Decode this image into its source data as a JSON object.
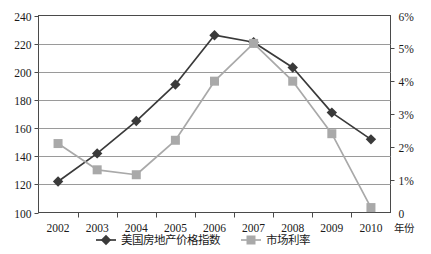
{
  "chart_data": {
    "type": "line",
    "title": "",
    "xlabel": "年份",
    "ylabel": "",
    "x": [
      2002,
      2003,
      2004,
      2005,
      2006,
      2007,
      2008,
      2009,
      2010
    ],
    "categories": [
      "2002",
      "2003",
      "2004",
      "2005",
      "2006",
      "2007",
      "2008",
      "2009",
      "2010"
    ],
    "grid": true,
    "legend_position": "bottom",
    "series": [
      {
        "name": "美国房地产价格指数",
        "axis": "left",
        "marker": "diamond",
        "color": "#3a3a3a",
        "values": [
          122,
          142,
          165,
          191,
          226,
          221,
          203,
          171,
          152
        ]
      },
      {
        "name": "市场利率",
        "axis": "right",
        "marker": "square",
        "color": "#a9a9a9",
        "values": [
          2.1,
          1.3,
          1.15,
          2.2,
          4.0,
          5.15,
          4.0,
          2.4,
          0.15
        ],
        "value_unit": "%"
      }
    ],
    "axes": {
      "left": {
        "min": 100,
        "max": 240,
        "step": 20,
        "ticks": [
          "100",
          "120",
          "140",
          "160",
          "180",
          "200",
          "220",
          "240"
        ]
      },
      "right": {
        "min": 0,
        "max": 6,
        "step": 1,
        "unit": "%",
        "ticks": [
          "0",
          "1%",
          "2%",
          "3%",
          "4%",
          "5%",
          "6%"
        ]
      },
      "x": {
        "label": "年份",
        "ticks": [
          "2002",
          "2003",
          "2004",
          "2005",
          "2006",
          "2007",
          "2008",
          "2009",
          "2010"
        ]
      }
    },
    "legend": [
      {
        "label": "美国房地产价格指数",
        "color": "#3a3a3a",
        "marker": "diamond"
      },
      {
        "label": "市场利率",
        "color": "#a9a9a9",
        "marker": "square"
      }
    ],
    "colors": {
      "series_1": "#3a3a3a",
      "series_2": "#a9a9a9",
      "grid": "#9a9a9a",
      "frame": "#4a4a4a",
      "background": "#ffffff"
    }
  }
}
